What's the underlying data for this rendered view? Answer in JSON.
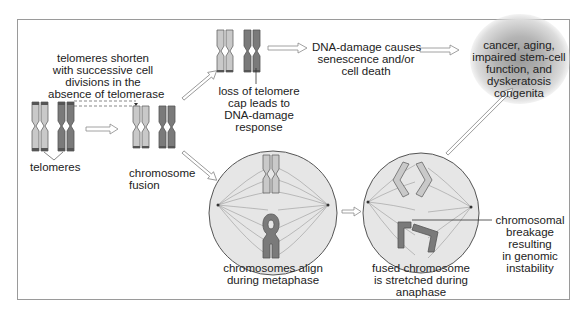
{
  "figure": {
    "colors": {
      "chromosome_light": "#c9c9c9",
      "chromosome_dark": "#7a7a7a",
      "telomere_cap": "#555555",
      "cell_fill": "#e6e6e6",
      "cell_border": "#555555",
      "arrow_fill": "#ffffff",
      "arrow_stroke": "#8a8a8a",
      "blob": "#9a9a9a",
      "frame_border": "#9a9a9a"
    }
  },
  "labels": {
    "telomeres_shorten": [
      "telomeres shorten",
      "with successive cell",
      "divisions in the",
      "absence of telomerase"
    ],
    "telomeres": "telomeres",
    "chromosome_fusion": [
      "chromosome",
      "fusion"
    ],
    "loss_of_cap": [
      "loss of telomere",
      "cap leads to",
      "DNA-damage",
      "response"
    ],
    "dna_damage": [
      "DNA-damage causes",
      "senescence and/or",
      "cell death"
    ],
    "outcomes": [
      "cancer, aging,",
      "impaired stem-cell",
      "function, and",
      "dyskeratosis",
      "congenita"
    ],
    "metaphase": [
      "chromosomes align",
      "during metaphase"
    ],
    "anaphase": [
      "fused chromosome",
      "is stretched during",
      "anaphase"
    ],
    "breakage": [
      "chromosomal",
      "breakage",
      "resulting",
      "in genomic",
      "instability"
    ]
  }
}
